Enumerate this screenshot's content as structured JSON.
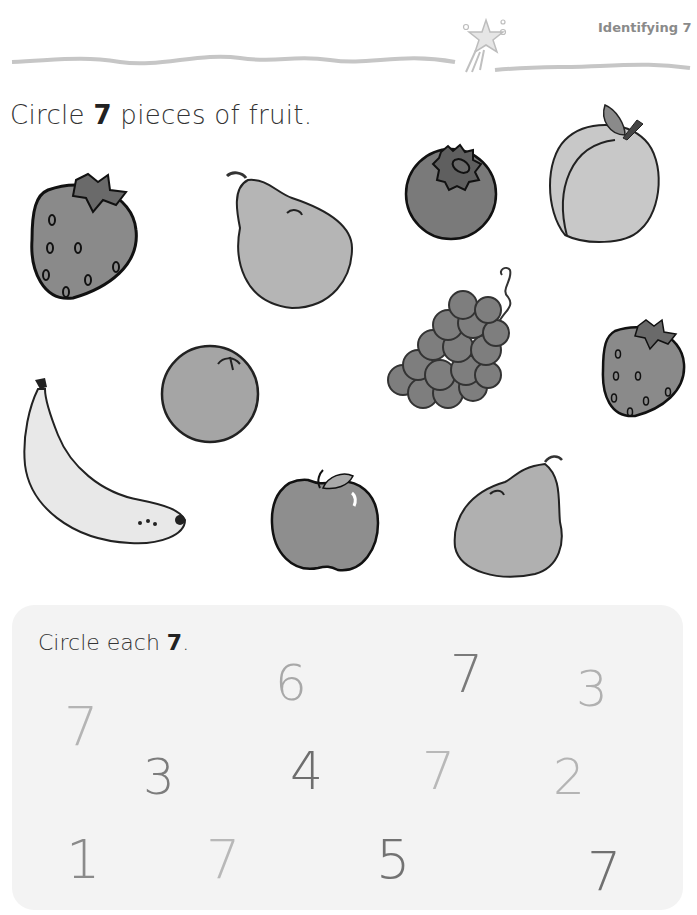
{
  "header": {
    "title": "Identifying 7"
  },
  "section1": {
    "instruction_prefix": "Circle ",
    "instruction_number": "7",
    "instruction_suffix": " pieces of fruit.",
    "fruits": [
      {
        "name": "strawberry",
        "color": "#8a8a8a"
      },
      {
        "name": "pear",
        "color": "#b5b5b5"
      },
      {
        "name": "blueberry",
        "color": "#7a7a7a"
      },
      {
        "name": "peach",
        "color": "#c8c8c8"
      },
      {
        "name": "grapes",
        "color": "#7e7e7e"
      },
      {
        "name": "orange",
        "color": "#a5a5a5"
      },
      {
        "name": "strawberry",
        "color": "#8a8a8a"
      },
      {
        "name": "banana",
        "color": "#e8e8e8"
      },
      {
        "name": "apple",
        "color": "#8e8e8e"
      },
      {
        "name": "pear",
        "color": "#b5b5b5"
      }
    ]
  },
  "section2": {
    "instruction_prefix": "Circle each ",
    "instruction_number": "7",
    "instruction_suffix": ".",
    "numerals": [
      {
        "value": "6",
        "x": 275,
        "y": 658,
        "size": 50,
        "color": "#a8a8a8"
      },
      {
        "value": "7",
        "x": 450,
        "y": 648,
        "size": 52,
        "color": "#7a7a7a"
      },
      {
        "value": "3",
        "x": 576,
        "y": 664,
        "size": 50,
        "color": "#b0b0b0"
      },
      {
        "value": "7",
        "x": 64,
        "y": 700,
        "size": 54,
        "color": "#b4b4b4"
      },
      {
        "value": "3",
        "x": 143,
        "y": 752,
        "size": 50,
        "color": "#7c7c7c"
      },
      {
        "value": "4",
        "x": 290,
        "y": 745,
        "size": 52,
        "color": "#6e6e6e"
      },
      {
        "value": "7",
        "x": 422,
        "y": 745,
        "size": 52,
        "color": "#b8b8b8"
      },
      {
        "value": "2",
        "x": 553,
        "y": 752,
        "size": 50,
        "color": "#b4b4b4"
      },
      {
        "value": "1",
        "x": 66,
        "y": 833,
        "size": 54,
        "color": "#8a8a8a"
      },
      {
        "value": "7",
        "x": 206,
        "y": 833,
        "size": 54,
        "color": "#b8b8b8"
      },
      {
        "value": "5",
        "x": 376,
        "y": 833,
        "size": 54,
        "color": "#727272"
      },
      {
        "value": "7",
        "x": 587,
        "y": 845,
        "size": 54,
        "color": "#707070"
      }
    ]
  }
}
